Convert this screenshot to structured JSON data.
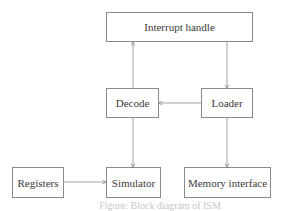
{
  "diagram": {
    "nodes": [
      {
        "id": "interrupt",
        "label": "Interrupt handle"
      },
      {
        "id": "decode",
        "label": "Decode"
      },
      {
        "id": "loader",
        "label": "Loader"
      },
      {
        "id": "registers",
        "label": "Registers"
      },
      {
        "id": "simulator",
        "label": "Simulator"
      },
      {
        "id": "memory",
        "label": "Memory interface"
      }
    ],
    "edges": [
      {
        "from": "decode",
        "to": "interrupt",
        "type": "directed"
      },
      {
        "from": "interrupt",
        "to": "loader",
        "type": "directed"
      },
      {
        "from": "loader",
        "to": "decode",
        "type": "directed"
      },
      {
        "from": "decode",
        "to": "simulator",
        "type": "directed"
      },
      {
        "from": "registers",
        "to": "simulator",
        "type": "bidirectional"
      },
      {
        "from": "loader",
        "to": "memory",
        "type": "bidirectional"
      }
    ],
    "caption": "Figure: Block diagram of ISM"
  }
}
